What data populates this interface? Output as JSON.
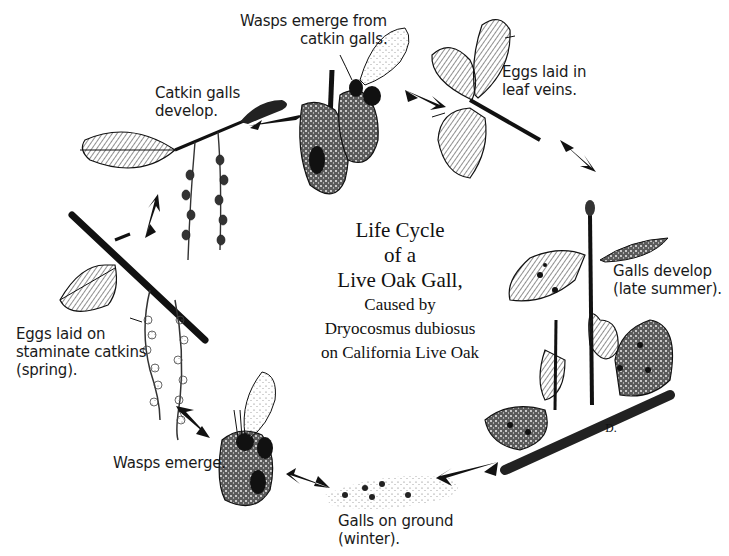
{
  "title": {
    "lines_large": [
      "Life Cycle",
      "of a",
      "Live Oak Gall,"
    ],
    "lines_small": [
      "Caused by",
      "Dryocosmus dubiosus",
      "on California Live Oak"
    ]
  },
  "stages": [
    {
      "id": "eggs-on-catkins",
      "lines": [
        "Eggs laid on",
        "staminate catkins",
        "(spring)."
      ]
    },
    {
      "id": "catkin-galls-develop",
      "lines": [
        "Catkin galls",
        "develop."
      ]
    },
    {
      "id": "wasps-emerge-from-catkin-galls",
      "lines": [
        "Wasps emerge from",
        "catkin galls."
      ]
    },
    {
      "id": "eggs-in-leaf-veins",
      "lines": [
        "Eggs laid in",
        "leaf veins."
      ]
    },
    {
      "id": "galls-develop-late-summer",
      "lines": [
        "Galls develop",
        "(late summer)."
      ]
    },
    {
      "id": "galls-on-ground",
      "lines": [
        "Galls on ground",
        "(winter)."
      ]
    },
    {
      "id": "wasps-emerge",
      "lines": [
        "Wasps emerge."
      ]
    }
  ],
  "artist_signature": "D.",
  "colors": {
    "ink": "#111111",
    "paper": "#ffffff",
    "shade": "#555555"
  }
}
